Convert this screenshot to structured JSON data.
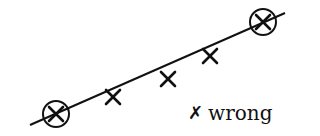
{
  "diagram": {
    "line": {
      "x1": 30,
      "y1": 125,
      "x2": 285,
      "y2": 13,
      "color": "#111111",
      "width": 2
    },
    "circled_points": [
      {
        "cx": 56,
        "cy": 114,
        "r": 13
      },
      {
        "cx": 263,
        "cy": 22,
        "r": 13
      }
    ],
    "points": [
      {
        "x": 56,
        "y": 114
      },
      {
        "x": 113,
        "y": 97
      },
      {
        "x": 168,
        "y": 79
      },
      {
        "x": 210,
        "y": 56
      },
      {
        "x": 263,
        "y": 22
      }
    ],
    "marker_size": 7,
    "legend": {
      "mark": "✗",
      "label": "wrong"
    }
  }
}
